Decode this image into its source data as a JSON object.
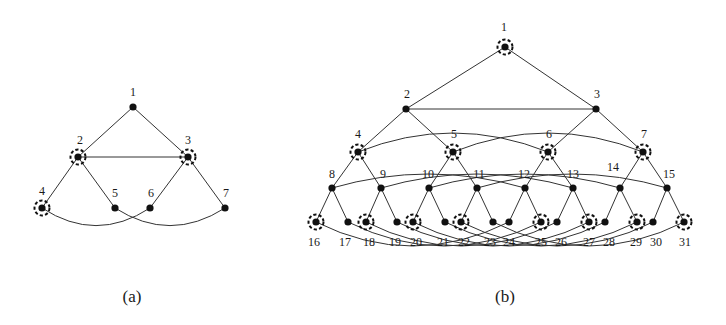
{
  "figure": {
    "panels": [
      {
        "caption": "(a)",
        "caption_pos": [
          132,
          302
        ],
        "nodes": [
          {
            "id": "1",
            "x": 133,
            "y": 107,
            "marked": false,
            "lx": 133,
            "ly": 96
          },
          {
            "id": "2",
            "x": 78,
            "y": 157,
            "marked": true,
            "lx": 80,
            "ly": 144
          },
          {
            "id": "3",
            "x": 188,
            "y": 157,
            "marked": true,
            "lx": 188,
            "ly": 144
          },
          {
            "id": "4",
            "x": 42,
            "y": 208,
            "marked": true,
            "lx": 42,
            "ly": 195
          },
          {
            "id": "5",
            "x": 115,
            "y": 208,
            "marked": false,
            "lx": 115,
            "ly": 197
          },
          {
            "id": "6",
            "x": 150,
            "y": 208,
            "marked": false,
            "lx": 151,
            "ly": 197
          },
          {
            "id": "7",
            "x": 225,
            "y": 208,
            "marked": false,
            "lx": 226,
            "ly": 197
          }
        ],
        "edges": [
          [
            "1",
            "2"
          ],
          [
            "1",
            "3"
          ],
          [
            "2",
            "3"
          ],
          [
            "2",
            "4"
          ],
          [
            "2",
            "5"
          ],
          [
            "3",
            "6"
          ],
          [
            "3",
            "7"
          ]
        ],
        "arcs": [
          [
            "4",
            "6"
          ],
          [
            "5",
            "7"
          ]
        ]
      },
      {
        "caption": "(b)",
        "caption_pos": [
          505,
          302
        ],
        "nodes": [
          {
            "id": "1",
            "x": 505,
            "y": 47,
            "marked": true,
            "lx": 504,
            "ly": 31
          },
          {
            "id": "2",
            "x": 406,
            "y": 109,
            "marked": false,
            "lx": 407,
            "ly": 98
          },
          {
            "id": "3",
            "x": 596,
            "y": 109,
            "marked": false,
            "lx": 597,
            "ly": 98
          },
          {
            "id": "4",
            "x": 358,
            "y": 152,
            "marked": true,
            "lx": 358,
            "ly": 138
          },
          {
            "id": "5",
            "x": 453,
            "y": 152,
            "marked": true,
            "lx": 454,
            "ly": 138
          },
          {
            "id": "6",
            "x": 548,
            "y": 152,
            "marked": true,
            "lx": 549,
            "ly": 138
          },
          {
            "id": "7",
            "x": 643,
            "y": 152,
            "marked": true,
            "lx": 644,
            "ly": 138
          },
          {
            "id": "8",
            "x": 332,
            "y": 188,
            "marked": false,
            "lx": 332,
            "ly": 178
          },
          {
            "id": "9",
            "x": 381,
            "y": 188,
            "marked": false,
            "lx": 383,
            "ly": 178
          },
          {
            "id": "10",
            "x": 429,
            "y": 188,
            "marked": false,
            "lx": 428,
            "ly": 178
          },
          {
            "id": "11",
            "x": 477,
            "y": 188,
            "marked": false,
            "lx": 479,
            "ly": 178
          },
          {
            "id": "12",
            "x": 525,
            "y": 188,
            "marked": false,
            "lx": 524,
            "ly": 178
          },
          {
            "id": "13",
            "x": 573,
            "y": 188,
            "marked": false,
            "lx": 573,
            "ly": 178
          },
          {
            "id": "14",
            "x": 620,
            "y": 188,
            "marked": false,
            "lx": 613,
            "ly": 171
          },
          {
            "id": "15",
            "x": 667,
            "y": 188,
            "marked": false,
            "lx": 669,
            "ly": 178
          },
          {
            "id": "16",
            "x": 316,
            "y": 222,
            "marked": true,
            "lx": 314,
            "ly": 246
          },
          {
            "id": "17",
            "x": 348,
            "y": 222,
            "marked": false,
            "lx": 345,
            "ly": 246
          },
          {
            "id": "18",
            "x": 366,
            "y": 222,
            "marked": true,
            "lx": 369,
            "ly": 246
          },
          {
            "id": "19",
            "x": 397,
            "y": 222,
            "marked": false,
            "lx": 395,
            "ly": 246
          },
          {
            "id": "20",
            "x": 413,
            "y": 222,
            "marked": true,
            "lx": 416,
            "ly": 246
          },
          {
            "id": "21",
            "x": 445,
            "y": 222,
            "marked": false,
            "lx": 443,
            "ly": 246
          },
          {
            "id": "22",
            "x": 461,
            "y": 222,
            "marked": true,
            "lx": 464,
            "ly": 246
          },
          {
            "id": "23",
            "x": 493,
            "y": 222,
            "marked": false,
            "lx": 490,
            "ly": 246
          },
          {
            "id": "24",
            "x": 509,
            "y": 222,
            "marked": false,
            "lx": 509,
            "ly": 246
          },
          {
            "id": "25",
            "x": 541,
            "y": 222,
            "marked": true,
            "lx": 541,
            "ly": 246
          },
          {
            "id": "26",
            "x": 557,
            "y": 222,
            "marked": false,
            "lx": 561,
            "ly": 246
          },
          {
            "id": "27",
            "x": 589,
            "y": 222,
            "marked": true,
            "lx": 589,
            "ly": 246
          },
          {
            "id": "28",
            "x": 605,
            "y": 222,
            "marked": false,
            "lx": 609,
            "ly": 246
          },
          {
            "id": "29",
            "x": 637,
            "y": 222,
            "marked": true,
            "lx": 636,
            "ly": 246
          },
          {
            "id": "30",
            "x": 653,
            "y": 222,
            "marked": false,
            "lx": 656,
            "ly": 246
          },
          {
            "id": "31",
            "x": 684,
            "y": 222,
            "marked": true,
            "lx": 685,
            "ly": 246
          }
        ],
        "edges": [
          [
            "1",
            "2"
          ],
          [
            "1",
            "3"
          ],
          [
            "2",
            "3"
          ],
          [
            "2",
            "4"
          ],
          [
            "2",
            "5"
          ],
          [
            "3",
            "6"
          ],
          [
            "3",
            "7"
          ],
          [
            "4",
            "8"
          ],
          [
            "4",
            "9"
          ],
          [
            "5",
            "10"
          ],
          [
            "5",
            "11"
          ],
          [
            "6",
            "12"
          ],
          [
            "6",
            "13"
          ],
          [
            "7",
            "14"
          ],
          [
            "7",
            "15"
          ],
          [
            "8",
            "16"
          ],
          [
            "8",
            "17"
          ],
          [
            "9",
            "18"
          ],
          [
            "9",
            "19"
          ],
          [
            "10",
            "20"
          ],
          [
            "10",
            "21"
          ],
          [
            "11",
            "22"
          ],
          [
            "11",
            "23"
          ],
          [
            "12",
            "24"
          ],
          [
            "12",
            "25"
          ],
          [
            "13",
            "26"
          ],
          [
            "13",
            "27"
          ],
          [
            "14",
            "28"
          ],
          [
            "14",
            "29"
          ],
          [
            "15",
            "30"
          ],
          [
            "15",
            "31"
          ]
        ],
        "arcs_level3": [
          [
            "4",
            "6"
          ],
          [
            "5",
            "7"
          ]
        ],
        "arcs_level4": [
          [
            "8",
            "12"
          ],
          [
            "9",
            "13"
          ],
          [
            "10",
            "14"
          ],
          [
            "11",
            "15"
          ]
        ],
        "arcs_level5": [
          [
            "16",
            "24"
          ],
          [
            "17",
            "25"
          ],
          [
            "18",
            "26"
          ],
          [
            "19",
            "27"
          ],
          [
            "20",
            "28"
          ],
          [
            "21",
            "29"
          ],
          [
            "22",
            "30"
          ],
          [
            "23",
            "31"
          ]
        ]
      }
    ]
  }
}
